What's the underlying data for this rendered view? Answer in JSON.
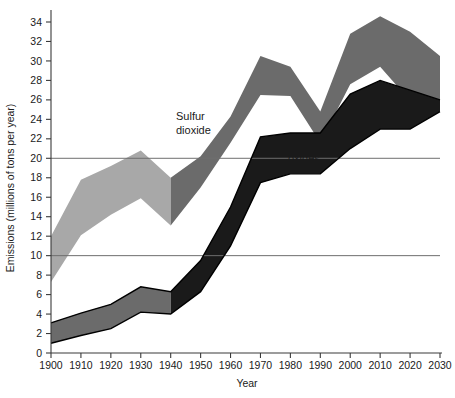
{
  "chart_data": {
    "type": "area",
    "title": "",
    "xlabel": "Year",
    "ylabel": "Emissions (millions of tons per year)",
    "xlim": [
      1900,
      2030
    ],
    "ylim": [
      0,
      35
    ],
    "xticks": [
      1900,
      1910,
      1920,
      1930,
      1940,
      1950,
      1960,
      1970,
      1980,
      1990,
      2000,
      2010,
      2020,
      2030
    ],
    "yticks": [
      0,
      2,
      4,
      6,
      8,
      10,
      12,
      14,
      16,
      18,
      20,
      22,
      24,
      26,
      28,
      30,
      32,
      34
    ],
    "gridlines_y": [
      10,
      20
    ],
    "grid": "horizontal-at-10-and-20",
    "legend_position": "inline-annotations",
    "x": [
      1900,
      1910,
      1920,
      1930,
      1940,
      1950,
      1960,
      1970,
      1980,
      1990,
      2000,
      2010,
      2020,
      2030
    ],
    "series": [
      {
        "name": "Sulfur dioxide",
        "kind": "band",
        "upper": [
          12.0,
          17.8,
          19.2,
          20.8,
          18.0,
          20.2,
          24.3,
          30.5,
          29.4,
          24.8,
          32.8,
          34.6,
          33.0,
          30.5
        ],
        "lower": [
          7.3,
          12.1,
          14.2,
          15.9,
          13.1,
          17.0,
          21.6,
          26.5,
          26.4,
          21.6,
          27.6,
          29.4,
          25.9,
          25.0
        ],
        "color_historical": "#a8a8a8",
        "color_projected": "#6b6b6b",
        "split_year": 1940
      },
      {
        "name": "Nitrogen oxides",
        "kind": "band",
        "upper": [
          3.1,
          4.1,
          5.0,
          6.8,
          6.3,
          9.5,
          15.0,
          22.2,
          22.6,
          22.6,
          26.6,
          28.0,
          27.0,
          26.0
        ],
        "lower": [
          1.0,
          1.8,
          2.5,
          4.2,
          4.0,
          6.3,
          11.0,
          17.5,
          18.4,
          18.4,
          21.0,
          23.0,
          23.0,
          24.8
        ],
        "color_historical": "#6b6b6b",
        "color_projected": "#1a1a1a",
        "split_year": 1940
      }
    ],
    "annotations": [
      {
        "text_line1": "Sulfur",
        "text_line2": "dioxide",
        "x_px": 176,
        "y_px": 120
      },
      {
        "text_line1": "Nitrogen",
        "text_line2": "oxides",
        "x_px": 288,
        "y_px": 148
      }
    ]
  },
  "axes": {
    "y_axis_title": "Emissions (millions of tons per year)",
    "x_axis_title": "Year",
    "y_tick_labels": [
      "0",
      "2",
      "4",
      "6",
      "8",
      "10",
      "12",
      "14",
      "16",
      "18",
      "20",
      "22",
      "24",
      "26",
      "28",
      "30",
      "32",
      "34"
    ],
    "x_tick_labels": [
      "1900",
      "1910",
      "1920",
      "1930",
      "1940",
      "1950",
      "1960",
      "1970",
      "1980",
      "1990",
      "2000",
      "2010",
      "2020",
      "2030"
    ]
  },
  "labels": {
    "sulfur_dioxide_line1": "Sulfur",
    "sulfur_dioxide_line2": "dioxide",
    "nitrogen_oxides_line1": "Nitrogen",
    "nitrogen_oxides_line2": "oxides"
  },
  "colors": {
    "sulfur_light": "#a8a8a8",
    "sulfur_dark": "#6b6b6b",
    "nitrogen_mid": "#6b6b6b",
    "nitrogen_dark": "#1a1a1a",
    "axis": "#3a3a3a",
    "grid": "#6e6e6e",
    "background": "#ffffff",
    "text": "#1a1a1a"
  }
}
